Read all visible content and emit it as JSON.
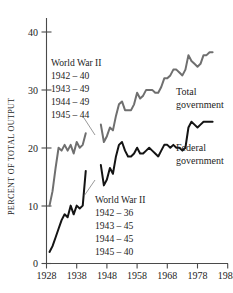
{
  "chart_data": {
    "type": "line",
    "title": "",
    "xlabel": "",
    "ylabel": "PERCENT OF TOTAL OUTPUT",
    "xlim": [
      1928,
      1988
    ],
    "ylim": [
      0,
      42
    ],
    "grid": false,
    "legend_position": "inline-right",
    "xticks": [
      1928,
      1938,
      1948,
      1958,
      1968,
      1978,
      1988
    ],
    "yticks": [
      0,
      10,
      20,
      30,
      40
    ],
    "series": [
      {
        "name": "Total government",
        "color": "#6f6f6f",
        "x": [
          1929,
          1930,
          1931,
          1932,
          1933,
          1934,
          1935,
          1936,
          1937,
          1938,
          1939,
          1940,
          1941,
          1946,
          1947,
          1948,
          1949,
          1950,
          1951,
          1952,
          1953,
          1954,
          1955,
          1956,
          1957,
          1958,
          1959,
          1960,
          1961,
          1962,
          1963,
          1964,
          1965,
          1966,
          1967,
          1968,
          1969,
          1970,
          1971,
          1972,
          1973,
          1974,
          1975,
          1976,
          1977,
          1978,
          1979,
          1980,
          1981,
          1982,
          1983
        ],
        "values": [
          10.0,
          12.5,
          16.5,
          20.0,
          19.5,
          20.5,
          19.5,
          20.5,
          19.0,
          21.0,
          20.0,
          20.5,
          22.5,
          24.0,
          21.0,
          22.0,
          23.5,
          23.0,
          25.5,
          27.5,
          28.0,
          26.5,
          26.5,
          26.5,
          27.5,
          29.5,
          28.5,
          29.0,
          30.0,
          30.0,
          30.0,
          29.5,
          29.5,
          30.5,
          32.0,
          32.0,
          32.5,
          33.5,
          33.5,
          33.0,
          32.5,
          33.5,
          36.0,
          35.0,
          34.5,
          34.0,
          34.5,
          36.0,
          36.0,
          36.5,
          36.5
        ],
        "gap_years": [
          1942,
          1943,
          1944,
          1945
        ],
        "war_values": {
          "1942": 40,
          "1943": 49,
          "1944": 49,
          "1945": 44
        }
      },
      {
        "name": "Federal government",
        "color": "#141414",
        "x": [
          1929,
          1930,
          1931,
          1932,
          1933,
          1934,
          1935,
          1936,
          1937,
          1938,
          1939,
          1940,
          1941,
          1946,
          1947,
          1948,
          1949,
          1950,
          1951,
          1952,
          1953,
          1954,
          1955,
          1956,
          1957,
          1958,
          1959,
          1960,
          1961,
          1962,
          1963,
          1964,
          1965,
          1966,
          1967,
          1968,
          1969,
          1970,
          1971,
          1972,
          1973,
          1974,
          1975,
          1976,
          1977,
          1978,
          1979,
          1980,
          1981,
          1982,
          1983
        ],
        "values": [
          2.0,
          3.0,
          4.5,
          6.0,
          7.5,
          8.5,
          8.0,
          10.0,
          8.5,
          10.0,
          9.5,
          10.0,
          16.0,
          17.0,
          13.5,
          14.5,
          16.5,
          15.5,
          18.5,
          20.5,
          21.0,
          19.5,
          18.5,
          18.5,
          19.0,
          20.0,
          19.0,
          19.0,
          19.5,
          20.0,
          19.5,
          19.0,
          18.5,
          19.5,
          20.5,
          20.5,
          20.0,
          20.5,
          20.0,
          20.0,
          19.5,
          20.0,
          23.5,
          24.5,
          24.0,
          23.5,
          24.0,
          24.5,
          24.5,
          24.5,
          24.5
        ],
        "gap_years": [
          1942,
          1943,
          1944,
          1945
        ],
        "war_values": {
          "1942": 36,
          "1943": 45,
          "1944": 45,
          "1945": 40
        }
      }
    ],
    "annotations": [
      {
        "id": "wwii-total",
        "title": "World War II",
        "rows": [
          "1942 – 40",
          "1943 – 49",
          "1944 – 49",
          "1945 – 44"
        ]
      },
      {
        "id": "wwii-federal",
        "title": "World War II",
        "rows": [
          "1942 – 36",
          "1943 – 45",
          "1944 – 45",
          "1945 – 40"
        ]
      }
    ]
  },
  "axis": {
    "ylabel": "PERCENT OF TOTAL OUTPUT",
    "yticks": [
      "40",
      "30",
      "20",
      "10",
      "0"
    ],
    "xticks": [
      "1928",
      "1938",
      "1948",
      "1958",
      "1968",
      "1978",
      "1988"
    ]
  },
  "series_labels": {
    "total_line1": "Total",
    "total_line2": "government",
    "federal_line1": "Federal",
    "federal_line2": "government"
  },
  "annotation_total": {
    "title": "World War II",
    "r1": "1942 – 40",
    "r2": "1943 – 49",
    "r3": "1944 – 49",
    "r4": "1945 – 44"
  },
  "annotation_federal": {
    "title": "World War II",
    "r1": "1942 – 36",
    "r2": "1943 – 45",
    "r3": "1944 – 45",
    "r4": "1945 – 40"
  },
  "colors": {
    "total": "#6f6f6f",
    "federal": "#141414",
    "axis": "#4a4a4a",
    "text": "#1d1d1d",
    "background": "#ffffff"
  }
}
